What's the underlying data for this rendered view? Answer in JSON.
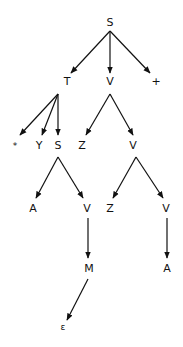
{
  "diagram": {
    "type": "tree",
    "nodes": [
      {
        "id": "n0",
        "label": "S",
        "x": 110,
        "y": 22
      },
      {
        "id": "n1",
        "label": "T",
        "x": 67,
        "y": 81
      },
      {
        "id": "n2",
        "label": "V",
        "x": 110,
        "y": 81
      },
      {
        "id": "n3",
        "label": "+",
        "x": 156,
        "y": 81
      },
      {
        "id": "n4",
        "label": "*",
        "x": 15,
        "y": 146
      },
      {
        "id": "n5",
        "label": "Y",
        "x": 39,
        "y": 145
      },
      {
        "id": "n6",
        "label": "S",
        "x": 58,
        "y": 145
      },
      {
        "id": "n7",
        "label": "Z",
        "x": 82,
        "y": 145
      },
      {
        "id": "n8",
        "label": "V",
        "x": 133,
        "y": 145
      },
      {
        "id": "n9",
        "label": "A",
        "x": 33,
        "y": 208
      },
      {
        "id": "n10",
        "label": "V",
        "x": 87,
        "y": 208
      },
      {
        "id": "n11",
        "label": "Z",
        "x": 110,
        "y": 208
      },
      {
        "id": "n12",
        "label": "V",
        "x": 166,
        "y": 208
      },
      {
        "id": "n13",
        "label": "M",
        "x": 89,
        "y": 268
      },
      {
        "id": "n14",
        "label": "A",
        "x": 167,
        "y": 268
      },
      {
        "id": "n15",
        "label": "ε",
        "x": 63,
        "y": 327
      }
    ],
    "edges": [
      {
        "from": "n0",
        "to": "n1",
        "x1": 110,
        "y1": 31,
        "x2": 71,
        "y2": 73
      },
      {
        "from": "n0",
        "to": "n2",
        "x1": 110,
        "y1": 31,
        "x2": 110,
        "y2": 73
      },
      {
        "from": "n0",
        "to": "n3",
        "x1": 110,
        "y1": 31,
        "x2": 150,
        "y2": 73
      },
      {
        "from": "n1",
        "to": "n4",
        "x1": 58,
        "y1": 94,
        "x2": 20,
        "y2": 135
      },
      {
        "from": "n1",
        "to": "n5",
        "x1": 58,
        "y1": 94,
        "x2": 42,
        "y2": 135
      },
      {
        "from": "n1",
        "to": "n6",
        "x1": 58,
        "y1": 94,
        "x2": 58,
        "y2": 135
      },
      {
        "from": "n2",
        "to": "n7",
        "x1": 110,
        "y1": 94,
        "x2": 86,
        "y2": 135
      },
      {
        "from": "n2",
        "to": "n8",
        "x1": 110,
        "y1": 94,
        "x2": 133,
        "y2": 135
      },
      {
        "from": "n6",
        "to": "n9",
        "x1": 58,
        "y1": 157,
        "x2": 36,
        "y2": 198
      },
      {
        "from": "n6",
        "to": "n10",
        "x1": 58,
        "y1": 157,
        "x2": 83,
        "y2": 198
      },
      {
        "from": "n8",
        "to": "n11",
        "x1": 136,
        "y1": 157,
        "x2": 113,
        "y2": 198
      },
      {
        "from": "n8",
        "to": "n12",
        "x1": 136,
        "y1": 157,
        "x2": 163,
        "y2": 198
      },
      {
        "from": "n10",
        "to": "n13",
        "x1": 88,
        "y1": 218,
        "x2": 88,
        "y2": 258
      },
      {
        "from": "n12",
        "to": "n14",
        "x1": 167,
        "y1": 218,
        "x2": 167,
        "y2": 258
      },
      {
        "from": "n13",
        "to": "n15",
        "x1": 88,
        "y1": 279,
        "x2": 67,
        "y2": 320
      }
    ]
  }
}
